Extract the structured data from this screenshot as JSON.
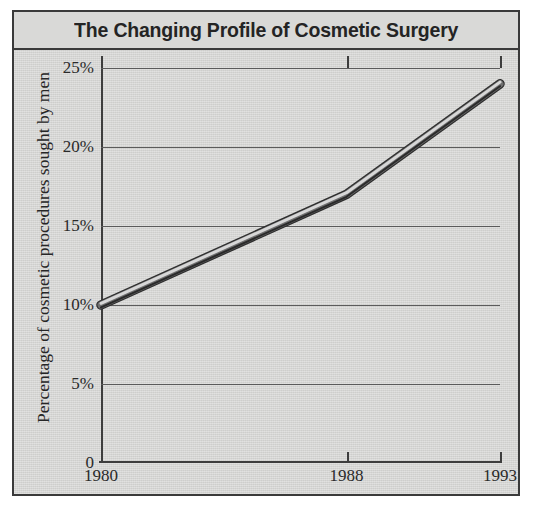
{
  "figure": {
    "title": "The Changing Profile of Cosmetic Surgery",
    "background_color": "#d3d3d1",
    "border_color": "#3a3a3a",
    "line_color": "#4a4a4a"
  },
  "chart_data": {
    "type": "line",
    "title": "The Changing Profile of Cosmetic Surgery",
    "xlabel": "",
    "ylabel": "Percentage of cosmetic procedures sought by men",
    "x": [
      1980,
      1988,
      1993
    ],
    "xtick_labels": [
      "1980",
      "1988",
      "1993"
    ],
    "values": [
      10,
      17,
      24
    ],
    "ytick_values": [
      0,
      5,
      10,
      15,
      20,
      25
    ],
    "ytick_labels": [
      "0",
      "5%",
      "10%",
      "15%",
      "20%",
      "25%"
    ],
    "xlim": [
      1980,
      1993
    ],
    "ylim": [
      0,
      25
    ],
    "grid": "horizontal",
    "legend": "none",
    "series": [
      {
        "name": "Percentage of cosmetic procedures sought by men",
        "values": [
          10,
          17,
          24
        ]
      }
    ]
  }
}
